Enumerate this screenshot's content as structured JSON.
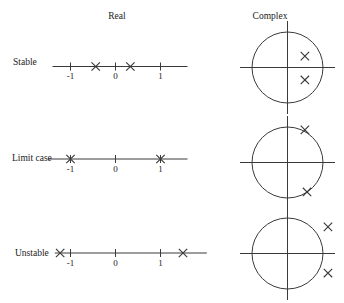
{
  "page": {
    "background": "#ffffff",
    "ink": "#3a3a3a",
    "text_color": "#222222"
  },
  "headers": {
    "real": "Real",
    "complex": "Complex"
  },
  "glyphs": {
    "pole_mark": "x-cross"
  },
  "diagram": {
    "description_visible_text_only": false,
    "rows": [
      {
        "label": "Stable",
        "real_axis": {
          "tick_labels": [
            "-1",
            "0",
            "1"
          ],
          "ticks": [
            -1,
            0,
            1
          ],
          "poles": [
            -0.44,
            0.33
          ],
          "range": [
            -1.4,
            1.6
          ]
        },
        "complex_plane": {
          "unit_circle": true,
          "poles": [
            {
              "re": 0.49,
              "im": 0.32
            },
            {
              "re": 0.49,
              "im": -0.35
            }
          ]
        }
      },
      {
        "label": "Limit case",
        "real_axis": {
          "tick_labels": [
            "-1",
            "0",
            "1"
          ],
          "ticks": [
            -1,
            0,
            1
          ],
          "poles": [
            -1,
            1
          ],
          "range": [
            -1.5,
            1.6
          ]
        },
        "complex_plane": {
          "unit_circle": true,
          "poles": [
            {
              "re": 0.49,
              "im": 0.92
            },
            {
              "re": 0.55,
              "im": -0.83
            }
          ]
        }
      },
      {
        "label": "Unstable",
        "real_axis": {
          "tick_labels": [
            "-1",
            "0",
            "1"
          ],
          "ticks": [
            -1,
            0,
            1
          ],
          "poles": [
            -1.23,
            1.5
          ],
          "range": [
            -1.35,
            2.03
          ]
        },
        "complex_plane": {
          "unit_circle": true,
          "poles": [
            {
              "re": 1.14,
              "im": 0.75
            },
            {
              "re": 1.14,
              "im": -0.55
            }
          ]
        }
      }
    ]
  },
  "geometry": {
    "real_origin_x": 115.5,
    "real_unit_px": 45,
    "tick_half": 4,
    "axis_y": [
      66.5,
      159,
      253
    ],
    "circle_cx": 287.5,
    "circle_cy": [
      67.5,
      162.5,
      253.5
    ],
    "circle_r": 35.5,
    "h_overhang": 12,
    "v_overhang": 11,
    "mark_half": 4.2
  }
}
